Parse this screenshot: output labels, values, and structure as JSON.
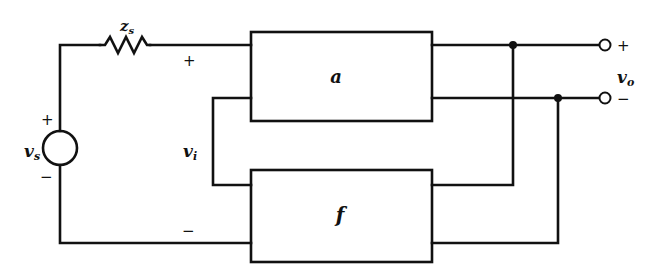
{
  "diagram": {
    "type": "feedback-amplifier-block-diagram",
    "blocks": {
      "forward": {
        "label": "a"
      },
      "feedback": {
        "label": "f"
      }
    },
    "source": {
      "voltage_label": "v",
      "voltage_sub": "s",
      "plus": "+",
      "minus": "−"
    },
    "impedance": {
      "label": "z",
      "sub": "s"
    },
    "input": {
      "label": "v",
      "sub": "i",
      "plus": "+",
      "minus": "−"
    },
    "output": {
      "label": "v",
      "sub": "o",
      "plus": "+",
      "minus": "−"
    },
    "stroke_color": "#111111",
    "background_color": "#ffffff"
  }
}
